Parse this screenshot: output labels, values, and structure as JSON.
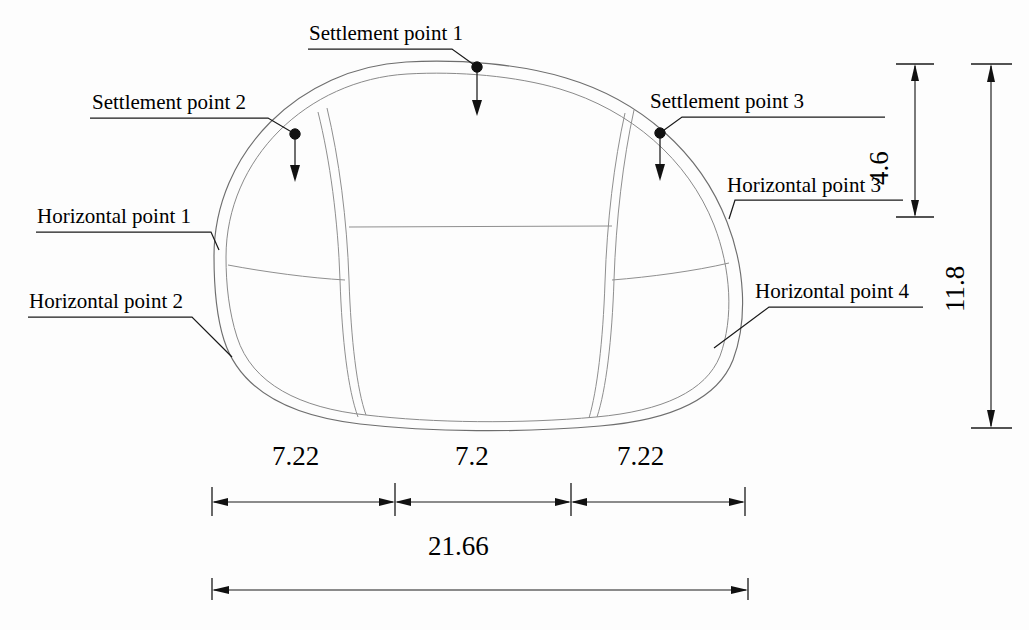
{
  "figure": {
    "type": "engineering-cross-section",
    "units": "m"
  },
  "annotations": {
    "settlement_points": [
      {
        "id": "settlement-point-1",
        "label": "Settlement point 1"
      },
      {
        "id": "settlement-point-2",
        "label": "Settlement point 2"
      },
      {
        "id": "settlement-point-3",
        "label": "Settlement point 3"
      }
    ],
    "horizontal_points": [
      {
        "id": "horizontal-point-1",
        "label": "Horizontal  point 1"
      },
      {
        "id": "horizontal-point-2",
        "label": "Horizontal  point 2"
      },
      {
        "id": "horizontal-point-3",
        "label": "Horizontal  point 3"
      },
      {
        "id": "horizontal-point-4",
        "label": "Horizontal  point 4"
      }
    ]
  },
  "dimensions": {
    "horizontal": [
      {
        "id": "span-left",
        "value": "7.22"
      },
      {
        "id": "span-center",
        "value": "7.2"
      },
      {
        "id": "span-right",
        "value": "7.22"
      },
      {
        "id": "span-total",
        "value": "21.66"
      }
    ],
    "vertical": [
      {
        "id": "height-upper",
        "value": "4.6"
      },
      {
        "id": "height-total",
        "value": "11.8"
      }
    ]
  },
  "colors": {
    "outline": "#6e6e6e",
    "partition": "#8f8f8f",
    "annotation": "#111111",
    "background": "#fdfdfd"
  }
}
